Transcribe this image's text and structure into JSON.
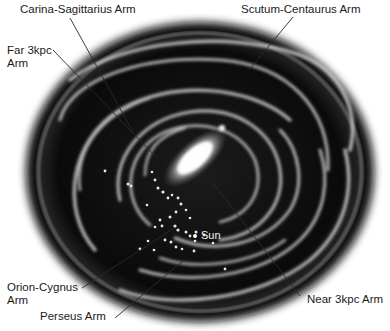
{
  "diagram": {
    "labels": {
      "carina_sagittarius": "Carina-Sagittarius Arm",
      "scutum_centaurus": "Scutum-Centaurus Arm",
      "far_3kpc_line1": "Far 3kpc",
      "far_3kpc_line2": "Arm",
      "orion_cygnus_line1": "Orion-Cygnus",
      "orion_cygnus_line2": "Arm",
      "perseus": "Perseus Arm",
      "near_3kpc": "Near 3kpc Arm",
      "sun": "Sun"
    },
    "colors": {
      "background": "#ffffff",
      "disk": "#0b0b0b",
      "arms": "#d8d8d8",
      "bulge": "#ffffff",
      "text": "#1a1a1a",
      "leader_line": "#2a2a2a"
    }
  }
}
